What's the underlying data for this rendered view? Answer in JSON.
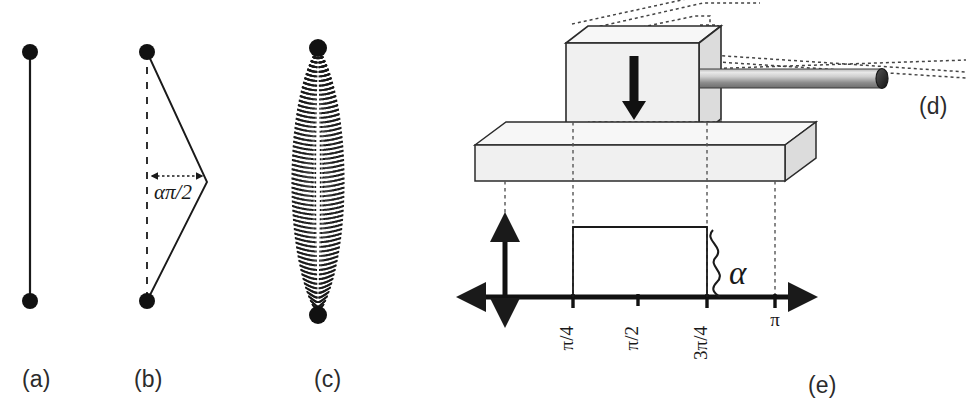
{
  "figure": {
    "width": 967,
    "height": 417,
    "background": "#ffffff",
    "ink_color": "#1a1a1a",
    "panel_fill": "#f0f0f0",
    "rod_color_light": "#d8d8d8",
    "rod_color_dark": "#707070"
  },
  "captions": {
    "a": "(a)",
    "b": "(b)",
    "c": "(c)",
    "d": "(d)",
    "e": "(e)"
  },
  "panel_a": {
    "name": "straight-string-two-endpoints",
    "endpoint_top": [
      30,
      52
    ],
    "endpoint_bottom": [
      30,
      301
    ],
    "dot_radius": 8
  },
  "panel_b": {
    "name": "triangular-kink-string",
    "endpoint_top": [
      147,
      52
    ],
    "endpoint_bottom": [
      147,
      301
    ],
    "apex": [
      207,
      182
    ],
    "dimension_label": "απ/2",
    "dimension_arrow_from": [
      148,
      176
    ],
    "dimension_arrow_to": [
      206,
      176
    ],
    "dot_radius": 8
  },
  "panel_c": {
    "name": "dotted-arc-family-lens",
    "endpoint_top": [
      318,
      48
    ],
    "endpoint_bottom": [
      318,
      315
    ],
    "max_half_width": 26,
    "num_arcs": 26,
    "dot_radius": 9
  },
  "panel_d": {
    "name": "hammer-block-and-rod",
    "block": {
      "front_x": 566,
      "front_y": 43,
      "front_w": 133,
      "front_h": 93,
      "depth_x": 22,
      "depth_y": -17
    },
    "arrow": {
      "label": "downward-force-arrow",
      "x": 634,
      "y_top": 58,
      "y_bottom": 112
    },
    "rod": {
      "x_start": 700,
      "x_end": 887,
      "y_center": 78,
      "half_height": 9
    },
    "dotted_guides": 4
  },
  "panel_e": {
    "name": "square-pulse-plot",
    "slab": {
      "front_x": 475,
      "front_y": 145,
      "front_w": 310,
      "front_h": 36,
      "depth_x": 31,
      "depth_y": -23
    },
    "axes": {
      "x_axis_y": 297,
      "x_axis_from": 462,
      "x_axis_to": 817,
      "y_axis_x": 505,
      "y_axis_top": 212,
      "y_axis_bottom": 328
    },
    "ticks": [
      {
        "label": "π/4",
        "x": 573,
        "rotated": true
      },
      {
        "label": "π/2",
        "x": 638,
        "rotated": true
      },
      {
        "label": "3π/4",
        "x": 707,
        "rotated": true
      },
      {
        "label": "π",
        "x": 775,
        "rotated": false
      }
    ],
    "pulse": {
      "x_start": 573,
      "x_end": 707,
      "top_y": 227,
      "baseline_y": 297
    },
    "brace_label": "α",
    "brace_x": 716,
    "brace_label_x": 739,
    "brace_label_y": 273,
    "projection_lines_x": [
      505,
      573,
      707,
      775
    ]
  },
  "chart_data": {
    "type": "bar",
    "title": "",
    "xlabel": "",
    "ylabel": "",
    "categories": [
      "π/4",
      "π/2",
      "3π/4",
      "π"
    ],
    "tick_values": [
      0.7854,
      1.5708,
      2.3562,
      3.1416
    ],
    "series": [
      {
        "name": "initial velocity profile",
        "values": [
          1,
          1,
          0,
          0
        ]
      }
    ],
    "pulse_support": [
      0.7854,
      2.3562
    ],
    "pulse_amplitude": 1,
    "amplitude_label": "α",
    "xlim": [
      0,
      3.1416
    ],
    "grid": false,
    "legend": "none"
  }
}
